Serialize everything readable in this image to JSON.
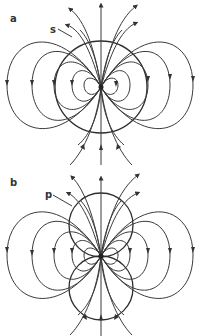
{
  "figure": {
    "panels": [
      {
        "id": "a",
        "label": "a",
        "annotation": "s",
        "description": "Dipole field lines with a single large spherical surface s centred on the dipole"
      },
      {
        "id": "b",
        "label": "b",
        "annotation": "p",
        "description": "Dipole field lines with two tangent spherical surfaces p above and below the dipole"
      }
    ],
    "colors": {
      "background": "#ffffff",
      "lines": "#3a3a3a"
    }
  }
}
